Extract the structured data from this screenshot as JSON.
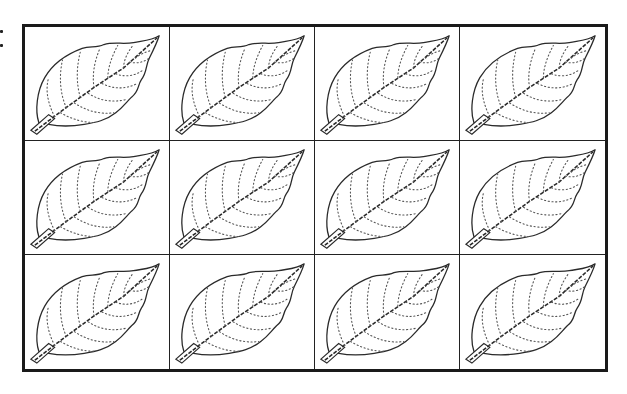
{
  "label": {
    "text": ":"
  },
  "grid": {
    "rows": 3,
    "columns": 4,
    "border_color": "#1a1a1a",
    "cells": [
      {
        "row": 1,
        "col": 1,
        "content": "leaf-icon"
      },
      {
        "row": 1,
        "col": 2,
        "content": "leaf-icon"
      },
      {
        "row": 1,
        "col": 3,
        "content": "leaf-icon"
      },
      {
        "row": 1,
        "col": 4,
        "content": "leaf-icon"
      },
      {
        "row": 2,
        "col": 1,
        "content": "leaf-icon"
      },
      {
        "row": 2,
        "col": 2,
        "content": "leaf-icon"
      },
      {
        "row": 2,
        "col": 3,
        "content": "leaf-icon"
      },
      {
        "row": 2,
        "col": 4,
        "content": "leaf-icon"
      },
      {
        "row": 3,
        "col": 1,
        "content": "leaf-icon"
      },
      {
        "row": 3,
        "col": 2,
        "content": "leaf-icon"
      },
      {
        "row": 3,
        "col": 3,
        "content": "leaf-icon"
      },
      {
        "row": 3,
        "col": 4,
        "content": "leaf-icon"
      }
    ]
  }
}
